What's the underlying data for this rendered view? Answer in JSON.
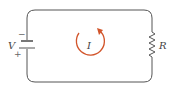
{
  "diagram": {
    "type": "circuit",
    "components": {
      "battery": {
        "label": "V",
        "negative_sign": "−",
        "positive_sign": "+"
      },
      "resistor": {
        "label": "R"
      },
      "current": {
        "label": "I",
        "direction": "clockwise"
      }
    },
    "colors": {
      "wire": "#555555",
      "current_arrow": "#d2552b",
      "text": "#444444"
    }
  }
}
